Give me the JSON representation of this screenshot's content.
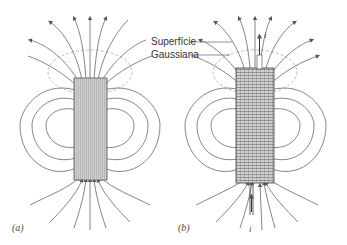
{
  "figure": {
    "panels": [
      {
        "id": "a",
        "label": "(a)",
        "description": "bar magnet field lines"
      },
      {
        "id": "b",
        "label": "(b)",
        "description": "solenoid field lines with current"
      }
    ],
    "annotation": {
      "line1": "Superfície",
      "line2": "Gaussiana"
    },
    "current_symbol_top": "i",
    "current_symbol_bottom": "i",
    "colors": {
      "field_line": "#777777",
      "arrow": "#555555",
      "body_fill": "#bbbbbb",
      "gaussian_surface": "#999999",
      "text": "#333333"
    }
  }
}
